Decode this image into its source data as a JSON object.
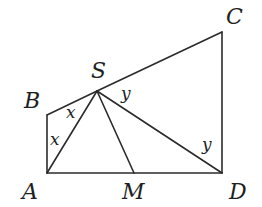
{
  "diagram": {
    "type": "geometry",
    "vertices": {
      "A": {
        "label": "A",
        "x": 47,
        "y": 173
      },
      "B": {
        "label": "B",
        "x": 47,
        "y": 115
      },
      "S": {
        "label": "S",
        "x": 97,
        "y": 91
      },
      "C": {
        "label": "C",
        "x": 222,
        "y": 32
      },
      "D": {
        "label": "D",
        "x": 222,
        "y": 173
      },
      "M": {
        "label": "M",
        "x": 134,
        "y": 173
      }
    },
    "segments": [
      "AB",
      "BS",
      "SC",
      "CD",
      "DA",
      "SA",
      "SM",
      "SD"
    ],
    "angle_labels": [
      {
        "text": "x",
        "at": "BS/SA near S"
      },
      {
        "text": "x",
        "at": "AB/AS near A"
      },
      {
        "text": "y",
        "at": "SC/SD near S"
      },
      {
        "text": "y",
        "at": "DS/DC near D"
      }
    ],
    "stroke_color": "#2b2b2b"
  }
}
